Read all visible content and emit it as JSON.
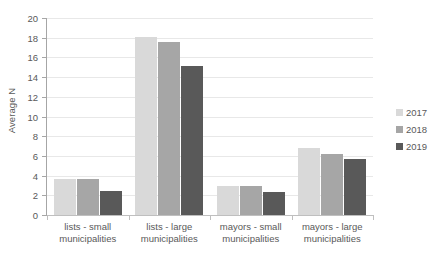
{
  "chart_data": {
    "type": "bar",
    "title": "",
    "xlabel": "",
    "ylabel": "Average N",
    "ylim": [
      0,
      20
    ],
    "ytick_step": 2,
    "yticks": [
      20,
      18,
      16,
      14,
      12,
      10,
      8,
      6,
      4,
      2,
      0
    ],
    "grid": true,
    "legend_position": "right",
    "categories": [
      "lists - small municipalities",
      "lists - large municipalities",
      "mayors - small municipalities",
      "mayors - large municipalities"
    ],
    "category_lines": [
      {
        "line1": "lists - small",
        "line2": "municipalities"
      },
      {
        "line1": "lists - large",
        "line2": "municipalities"
      },
      {
        "line1": "mayors - small",
        "line2": "municipalities"
      },
      {
        "line1": "mayors - large",
        "line2": "municipalities"
      }
    ],
    "series": [
      {
        "name": "2017",
        "color": "#d9d9d9",
        "values": [
          3.7,
          18.1,
          2.9,
          6.8
        ]
      },
      {
        "name": "2018",
        "color": "#a6a6a6",
        "values": [
          3.7,
          17.6,
          2.9,
          6.2
        ]
      },
      {
        "name": "2019",
        "color": "#595959",
        "values": [
          2.4,
          15.1,
          2.3,
          5.7
        ]
      }
    ]
  },
  "legend": {
    "items": [
      {
        "label": "2017",
        "color": "#d9d9d9"
      },
      {
        "label": "2018",
        "color": "#a6a6a6"
      },
      {
        "label": "2019",
        "color": "#595959"
      }
    ]
  },
  "colors": {
    "series_2017": "#d9d9d9",
    "series_2018": "#a6a6a6",
    "series_2019": "#595959",
    "gridline": "#e8e8e8",
    "axis": "#a6a6a6",
    "text": "#595959",
    "background": "#ffffff"
  }
}
